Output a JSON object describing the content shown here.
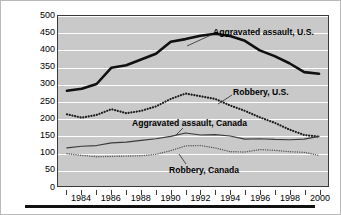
{
  "chart_data": {
    "type": "line",
    "title": "",
    "xlabel": "",
    "ylabel": "Rate per 100,000 population",
    "xlim": [
      1983,
      2000
    ],
    "ylim": [
      0,
      500
    ],
    "ytick_step": 50,
    "yticks": [
      0,
      50,
      100,
      150,
      200,
      250,
      300,
      350,
      400,
      450,
      500
    ],
    "ytick_labels": [
      "0",
      "50",
      "100",
      "150",
      "200",
      "250",
      "300",
      "350",
      "400",
      "450",
      "500"
    ],
    "xticks": [
      1983,
      1984,
      1985,
      1986,
      1987,
      1988,
      1989,
      1990,
      1991,
      1992,
      1993,
      1994,
      1995,
      1996,
      1997,
      1998,
      1999,
      2000
    ],
    "xtick_labels_shown": [
      "1984",
      "1986",
      "1988",
      "1990",
      "1992",
      "1994",
      "1996",
      "1998",
      "2000"
    ],
    "xtick_label_years": [
      1984,
      1986,
      1988,
      1990,
      1992,
      1994,
      1996,
      1998,
      2000
    ],
    "x": [
      1983,
      1984,
      1985,
      1986,
      1987,
      1988,
      1989,
      1990,
      1991,
      1992,
      1993,
      1994,
      1995,
      1996,
      1997,
      1998,
      1999,
      2000
    ],
    "grid": "horizontal-white",
    "legend_position": "inline-annotations",
    "plot_background": "#c9c9c9",
    "series": [
      {
        "name": "Aggravated assault, U.S.",
        "style": "solid-thick",
        "color": "#101010",
        "values": [
          280,
          286,
          300,
          348,
          355,
          372,
          389,
          424,
          432,
          442,
          448,
          441,
          427,
          399,
          382,
          361,
          335,
          330
        ]
      },
      {
        "name": "Robbery, U.S.",
        "style": "dotted-bold",
        "color": "#1a1a1a",
        "values": [
          211,
          201,
          209,
          226,
          214,
          221,
          234,
          256,
          272,
          264,
          256,
          237,
          221,
          202,
          186,
          166,
          150,
          145
        ]
      },
      {
        "name": "Aggravated assault, Canada",
        "style": "solid-thin",
        "color": "#3a3a3a",
        "values": [
          112,
          117,
          119,
          127,
          129,
          134,
          139,
          146,
          156,
          150,
          151,
          147,
          138,
          139,
          137,
          136,
          138,
          146
        ]
      },
      {
        "name": "Robbery, Canada",
        "style": "dotted-thin",
        "color": "#585858",
        "values": [
          95,
          90,
          86,
          87,
          88,
          89,
          93,
          104,
          118,
          119,
          112,
          101,
          100,
          107,
          105,
          101,
          99,
          90
        ]
      }
    ],
    "annotations": [
      {
        "text": "Aggravated assault, U.S.",
        "left_px": 212,
        "top_px": 26,
        "leader": {
          "x1": 210,
          "y1": 34,
          "x2": 186,
          "y2": 45
        }
      },
      {
        "text": "Robbery, U.S.",
        "left_px": 232,
        "top_px": 86,
        "leader": {
          "x1": 231,
          "y1": 94,
          "x2": 217,
          "y2": 103
        }
      },
      {
        "text": "Aggravated assault, Canada",
        "left_px": 131,
        "top_px": 117,
        "leader": {
          "x1": 182,
          "y1": 127,
          "x2": 175,
          "y2": 134
        }
      },
      {
        "text": "Robbery, Canada",
        "left_px": 168,
        "top_px": 164,
        "leader": {
          "x1": 185,
          "y1": 163,
          "x2": 178,
          "y2": 153
        }
      }
    ]
  }
}
